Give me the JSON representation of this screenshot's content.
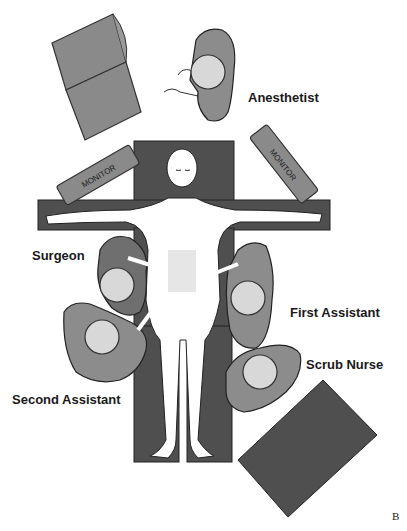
{
  "figure": {
    "panel_letter": "B"
  },
  "equipment": {
    "monitor_left": "MONITOR",
    "monitor_right": "MONITOR"
  },
  "staff": [
    {
      "role": "Anesthetist"
    },
    {
      "role": "Surgeon"
    },
    {
      "role": "First Assistant"
    },
    {
      "role": "Scrub Nurse"
    },
    {
      "role": "Second Assistant"
    }
  ],
  "colors": {
    "table": "#4f4f4f",
    "machine": "#8a8a8a",
    "gown": "#8c8c8c",
    "gown_dark": "#6f6f6f",
    "head": "#d8d8d8",
    "skin": "#ffffff",
    "outline": "#2a2a2a"
  }
}
